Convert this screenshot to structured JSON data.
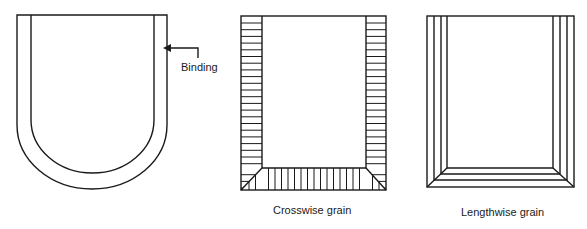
{
  "figures": [
    {
      "id": "binding-pocket",
      "callout": "Binding"
    },
    {
      "id": "crosswise",
      "caption": "Crosswise grain"
    },
    {
      "id": "lengthwise",
      "caption": "Lengthwise grain"
    }
  ],
  "colors": {
    "stroke": "#1a1a1a",
    "background": "#ffffff"
  }
}
